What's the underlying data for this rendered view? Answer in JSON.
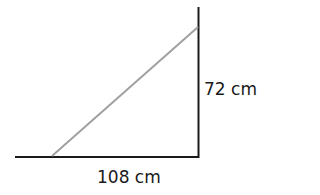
{
  "diagram": {
    "type": "right-triangle-ramp",
    "labels": {
      "vertical": "72 cm",
      "horizontal": "108 cm"
    },
    "colors": {
      "frame": "#1a1a1a",
      "hypotenuse": "#a0a0a0"
    },
    "dimensions": {
      "vertical_cm": 72,
      "horizontal_cm": 108
    }
  }
}
